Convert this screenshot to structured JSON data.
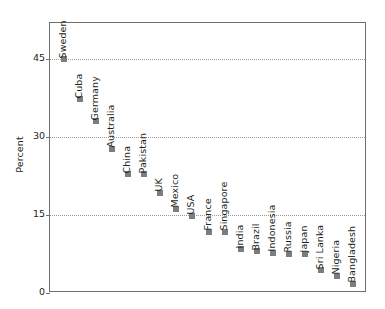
{
  "chart_data": {
    "type": "scatter",
    "title": "",
    "subtitle": "",
    "xlabel": "",
    "ylabel": "Percent",
    "ylim": [
      0,
      52
    ],
    "yticks": [
      0,
      15,
      30,
      45
    ],
    "ytick_labels": [
      "0",
      "15",
      "30",
      "45"
    ],
    "grid": "horizontal-dotted",
    "legend": "none",
    "marker_color": "#7d7d7d",
    "axis_color": "#6e6e6e",
    "text_color": "#231f20",
    "categories": [
      "Sweden",
      "Cuba",
      "Germany",
      "Australia",
      "China",
      "Pakistan",
      "UK",
      "Mexico",
      "USA",
      "France",
      "Singapore",
      "India",
      "Brazil",
      "Indonesia",
      "Russia",
      "Japan",
      "Sri Lanka",
      "Nigeria",
      "Bangladesh"
    ],
    "values": [
      45.0,
      37.3,
      33.1,
      27.8,
      22.9,
      22.9,
      19.3,
      16.2,
      14.9,
      11.8,
      11.8,
      8.4,
      8.0,
      7.8,
      7.6,
      7.6,
      4.4,
      3.3,
      1.8
    ],
    "points": [
      {
        "label": "Sweden",
        "value": 45.0
      },
      {
        "label": "Cuba",
        "value": 37.3
      },
      {
        "label": "Germany",
        "value": 33.1
      },
      {
        "label": "Australia",
        "value": 27.8
      },
      {
        "label": "China",
        "value": 22.9
      },
      {
        "label": "Pakistan",
        "value": 22.9
      },
      {
        "label": "UK",
        "value": 19.3
      },
      {
        "label": "Mexico",
        "value": 16.2
      },
      {
        "label": "USA",
        "value": 14.9
      },
      {
        "label": "France",
        "value": 11.8
      },
      {
        "label": "Singapore",
        "value": 11.8
      },
      {
        "label": "India",
        "value": 8.4
      },
      {
        "label": "Brazil",
        "value": 8.0
      },
      {
        "label": "Indonesia",
        "value": 7.8
      },
      {
        "label": "Russia",
        "value": 7.6
      },
      {
        "label": "Japan",
        "value": 7.6
      },
      {
        "label": "Sri Lanka",
        "value": 4.4
      },
      {
        "label": "Nigeria",
        "value": 3.3
      },
      {
        "label": "Bangladesh",
        "value": 1.8
      }
    ]
  }
}
